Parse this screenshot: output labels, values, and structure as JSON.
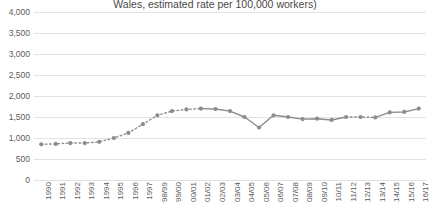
{
  "chart_data": {
    "type": "line",
    "title": "Wales, estimated rate per 100,000 workers)",
    "xlabel": "",
    "ylabel": "",
    "ylim": [
      0,
      4000
    ],
    "ytick_step": 500,
    "grid": true,
    "legend": "none",
    "marker": "circle",
    "series_color": "#8c8c8c",
    "grid_color": "#e2e2e2",
    "text_color": "#5a5a5a",
    "ytick_labels": [
      "4,000",
      "3,500",
      "3,000",
      "2,500",
      "2,000",
      "1,500",
      "1,000",
      "500",
      "0"
    ],
    "ytick_values": [
      4000,
      3500,
      3000,
      2500,
      2000,
      1500,
      1000,
      500,
      0
    ],
    "categories": [
      "1990",
      "1991",
      "1992",
      "1993",
      "1994",
      "1995",
      "1996",
      "1997",
      "98/99",
      "99/00",
      "00/01",
      "01/02",
      "02/03",
      "03/04",
      "04/05",
      "05/06",
      "06/07",
      "07/08",
      "08/09",
      "09/10",
      "10/11",
      "11/12",
      "12/13",
      "13/14",
      "14/15",
      "15/16",
      "16/17"
    ],
    "values": [
      850,
      860,
      880,
      880,
      910,
      1000,
      1120,
      1330,
      1540,
      1640,
      1680,
      1700,
      1690,
      1640,
      1500,
      1250,
      1540,
      1500,
      1450,
      1460,
      1430,
      1500,
      1500,
      1490,
      1610,
      1620,
      1700
    ],
    "dashed_segments": [
      [
        0,
        11
      ],
      [
        21,
        23
      ]
    ],
    "solid_segments": [
      [
        11,
        21
      ],
      [
        23,
        26
      ]
    ]
  }
}
